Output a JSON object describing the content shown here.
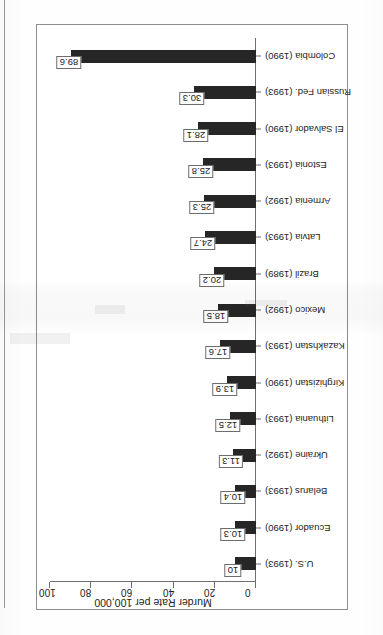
{
  "page": {
    "background_color": "#ffffff",
    "bar_color": "#262626",
    "frame_color": "#8d8d8d",
    "axis_color": "#6f6f6f"
  },
  "chart_data": {
    "type": "bar",
    "title": "",
    "subtitle": "",
    "xlabel": "",
    "ylabel": "Murder Rate per 100,000",
    "ylim": [
      0,
      100
    ],
    "yticks": [
      0,
      20,
      40,
      60,
      80,
      100
    ],
    "grid": false,
    "legend": false,
    "orientation": "vertical-bars-rotated-90",
    "categories": [
      "U.S. (1993)",
      "Ecuador (1990)",
      "Belarus (1993)",
      "Ukraine (1992)",
      "Lithuania (1993)",
      "Kirghizistan (1990)",
      "Kazakhstan (1993)",
      "Mexico (1992)",
      "Brazil (1989)",
      "Latvia (1993)",
      "Armenia (1992)",
      "Estonia (1993)",
      "El Salvador (1990)",
      "Russian Fed. (1993)",
      "Colombia (1990)"
    ],
    "values": [
      10,
      10.3,
      10.4,
      11.3,
      12.5,
      13.9,
      17.6,
      18.5,
      20.2,
      24.7,
      25.3,
      25.8,
      28.1,
      30.3,
      89.6
    ],
    "value_labels": [
      "10",
      "10.3",
      "10.4",
      "11.3",
      "12.5",
      "13.9",
      "17.6",
      "18.5",
      "20.2",
      "24.7",
      "25.3",
      "25.8",
      "28.1",
      "30.3",
      "89.6"
    ]
  }
}
